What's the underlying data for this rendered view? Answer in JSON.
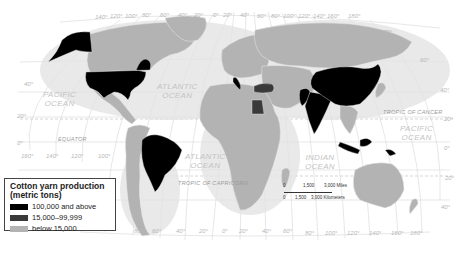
{
  "map": {
    "projection": "world",
    "colors": {
      "ocean": "#ffffff",
      "land_default": "#b3b3b3",
      "high": "#000000",
      "medium": "#3a3a3a",
      "grid": "#d0d0d0",
      "border": "#e8e8e8"
    },
    "oceans": [
      {
        "name": "PACIFIC\nOCEAN",
        "line1": "PACIFIC",
        "line2": "OCEAN"
      },
      {
        "name": "ATLANTIC\nOCEAN",
        "line1": "ATLANTIC",
        "line2": "OCEAN"
      },
      {
        "name": "ATLANTIC\nOCEAN",
        "line1": "ATLANTIC",
        "line2": "OCEAN"
      },
      {
        "name": "INDIAN\nOCEAN",
        "line1": "INDIAN",
        "line2": "OCEAN"
      },
      {
        "name": "PACIFIC\nOCEAN",
        "line1": "PACIFIC",
        "line2": "OCEAN"
      }
    ],
    "lines": {
      "equator": "EQUATOR",
      "tropic_cancer": "TROPIC OF CANCER",
      "tropic_capricorn": "TROPIC OF CAPRICORN"
    },
    "top_longitudes": [
      "140°",
      "120°",
      "100°",
      "80°",
      "60°",
      "40°",
      "20°",
      "0°",
      "20°",
      "40°",
      "60°",
      "80°",
      "100°",
      "120°",
      "140°",
      "160°",
      "180°"
    ],
    "bottom_longitudes": [
      "160°",
      "140°",
      "120°",
      "100°",
      "80°",
      "60°",
      "40°",
      "20°",
      "0°",
      "20°",
      "40°",
      "60°",
      "80°",
      "100°",
      "120°",
      "140°",
      "160°",
      "180°"
    ],
    "left_latitudes": [
      "40°",
      "20°",
      "0°"
    ],
    "right_latitudes": [
      "80°",
      "60°",
      "40°",
      "20°",
      "0°",
      "20°",
      "40°"
    ],
    "countries_high": [
      "United States",
      "Brazil",
      "Italy",
      "Pakistan",
      "India",
      "China",
      "Indonesia"
    ],
    "countries_medium": [
      "Turkey",
      "Egypt"
    ]
  },
  "legend": {
    "title_line1": "Cotton yarn production",
    "title_line2": "(metric tons)",
    "items": [
      {
        "label": "100,000 and above",
        "color": "#000000"
      },
      {
        "label": "15,000–99,999",
        "color": "#3a3a3a"
      },
      {
        "label": "below 15,000",
        "color": "#b3b3b3"
      }
    ]
  },
  "scale_bar": {
    "miles_0": "0",
    "miles_mid": "1,500",
    "miles_end": "3,000 Miles",
    "km_0": "0",
    "km_mid": "1,500",
    "km_end": "3,000 Kilometers"
  }
}
